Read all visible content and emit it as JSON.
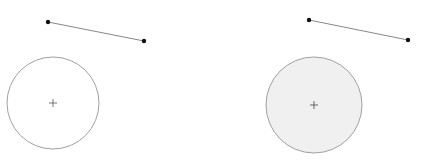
{
  "canvas": {
    "width": 421,
    "height": 163,
    "background": "#ffffff"
  },
  "panels": [
    {
      "name": "left-panel",
      "line": {
        "x1": 48,
        "y1": 22,
        "x2": 144,
        "y2": 41,
        "stroke": "#888888",
        "endpoint_color": "#111111"
      },
      "circle": {
        "cx": 53,
        "cy": 103,
        "r": 46,
        "fill": "#ffffff",
        "stroke": "#a0a0a0"
      },
      "center_marker": {
        "x": 53,
        "y": 103,
        "size": 4,
        "color": "#555555"
      }
    },
    {
      "name": "right-panel",
      "line": {
        "x1": 309,
        "y1": 20,
        "x2": 408,
        "y2": 40,
        "stroke": "#888888",
        "endpoint_color": "#111111"
      },
      "circle": {
        "cx": 314,
        "cy": 105,
        "r": 48,
        "fill": "#f0f0f0",
        "stroke": "#a0a0a0"
      },
      "center_marker": {
        "x": 314,
        "y": 105,
        "size": 4,
        "color": "#444444"
      }
    }
  ]
}
